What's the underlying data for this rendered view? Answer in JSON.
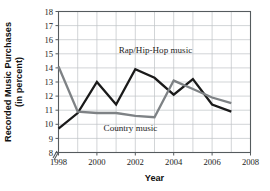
{
  "chart_data": {
    "type": "line",
    "title": "",
    "xlabel": "Year",
    "ylabel_line1": "Recorded Music Purchases",
    "ylabel_line2": "(in percent)",
    "x": [
      1998,
      1999,
      2000,
      2001,
      2002,
      2003,
      2004,
      2005,
      2006,
      2007
    ],
    "xlim": [
      1998,
      2008
    ],
    "ylim": [
      8,
      18
    ],
    "xticks": [
      1998,
      2000,
      2002,
      2004,
      2006,
      2008
    ],
    "xtick_labels": [
      "1998",
      "2000",
      "2002",
      "2004",
      "2006",
      "2008"
    ],
    "yticks": [
      8,
      9,
      10,
      11,
      12,
      13,
      14,
      15,
      16,
      17,
      18
    ],
    "ytick_labels": [
      "8",
      "9",
      "10",
      "11",
      "12",
      "13",
      "14",
      "15",
      "16",
      "17",
      "18"
    ],
    "grid": true,
    "grid_x_step": 1,
    "grid_y_step": 1,
    "y_axis_break": true,
    "legend_position": "inline-annotations",
    "series": [
      {
        "name": "Rap/Hip-Hop music",
        "color": "#1a1a1a",
        "stroke_width": 2.3,
        "values": [
          9.7,
          10.8,
          13.0,
          11.4,
          13.9,
          13.3,
          12.1,
          13.2,
          11.4,
          10.9
        ]
      },
      {
        "name": "Country music",
        "color": "#7e8285",
        "stroke_width": 2.3,
        "values": [
          14.1,
          10.9,
          10.8,
          10.8,
          10.6,
          10.5,
          13.1,
          12.5,
          11.9,
          11.5
        ]
      }
    ],
    "annotations": [
      {
        "text": "Rap/Hip-Hop music",
        "x": 2003.05,
        "y": 15.05,
        "anchor": "middle"
      },
      {
        "text": "Country music",
        "x": 2001.75,
        "y": 9.55,
        "anchor": "middle"
      }
    ]
  }
}
